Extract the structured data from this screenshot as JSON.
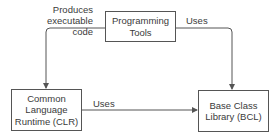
{
  "nodes": {
    "programming_tools": {
      "line1": "Programming",
      "line2": "Tools"
    },
    "clr": {
      "line1": "Common",
      "line2": "Language",
      "line3": "Runtime (CLR)"
    },
    "bcl": {
      "line1": "Base Class",
      "line2": "Library (BCL)"
    }
  },
  "edges": {
    "tools_to_clr": {
      "line1": "Produces",
      "line2": "executable",
      "line3": "code"
    },
    "tools_to_bcl": {
      "label": "Uses"
    },
    "clr_to_bcl": {
      "label": "Uses"
    }
  },
  "colors": {
    "line": "#555555",
    "text": "#3a3a3a"
  }
}
